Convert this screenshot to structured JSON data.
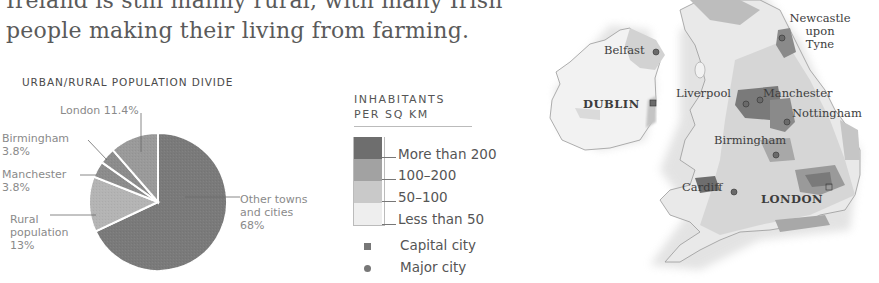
{
  "intro": {
    "line1": "Ireland is still mainly rural, with many Irish",
    "line2": "people making their living from farming."
  },
  "chart_data": {
    "type": "pie",
    "title": "URBAN/RURAL POPULATION DIVIDE",
    "categories": [
      "Other towns and cities",
      "Rural population",
      "Manchester",
      "Birmingham",
      "London"
    ],
    "values": [
      68,
      13,
      3.8,
      3.8,
      11.4
    ],
    "unit": "%",
    "colors": [
      "#7a7a7a",
      "#b4b4b4",
      "#8c8c8c",
      "#8c8c8c",
      "#9a9a9a"
    ],
    "labels": [
      {
        "name": "Other towns\nand cities",
        "value": "68%"
      },
      {
        "name": "Rural\npopulation",
        "value": "13%"
      },
      {
        "name": "Manchester",
        "value": "3.8%"
      },
      {
        "name": "Birmingham",
        "value": "3.8%"
      },
      {
        "name": "London",
        "value": "11.4%"
      }
    ]
  },
  "pie_labels": {
    "london": "London 11.4%",
    "birmingham_name": "Birmingham",
    "birmingham_value": "3.8%",
    "manchester_name": "Manchester",
    "manchester_value": "3.8%",
    "rural_line1": "Rural",
    "rural_line2": "population",
    "rural_value": "13%",
    "other_line1": "Other towns",
    "other_line2": "and cities",
    "other_value": "68%"
  },
  "legend": {
    "title_line1": "INHABITANTS",
    "title_line2": "PER SQ KM",
    "items": [
      {
        "label": "More than 200",
        "color": "#6e6e6e"
      },
      {
        "label": "100–200",
        "color": "#a2a2a2"
      },
      {
        "label": "50–100",
        "color": "#c9c9c9"
      },
      {
        "label": "Less than 50",
        "color": "#eeeeee"
      }
    ],
    "symbols": [
      {
        "label": "Capital city",
        "shape": "square-icon"
      },
      {
        "label": "Major city",
        "shape": "circle-icon"
      }
    ]
  },
  "map": {
    "cities": [
      {
        "name": "Belfast",
        "type": "major"
      },
      {
        "name": "DUBLIN",
        "type": "capital"
      },
      {
        "name": "Newcastle upon Tyne",
        "line1": "Newcastle",
        "line2": "upon",
        "line3": "Tyne",
        "type": "major"
      },
      {
        "name": "Liverpool",
        "type": "major"
      },
      {
        "name": "Manchester",
        "type": "major"
      },
      {
        "name": "Nottingham",
        "type": "major"
      },
      {
        "name": "Birmingham",
        "type": "major"
      },
      {
        "name": "Cardiff",
        "type": "major"
      },
      {
        "name": "LONDON",
        "type": "capital"
      }
    ]
  }
}
